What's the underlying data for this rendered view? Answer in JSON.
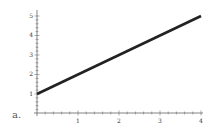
{
  "chart_data": {
    "type": "line",
    "title": "",
    "panel_label": "a.",
    "xlabel": "",
    "ylabel": "",
    "x_ticks": [
      "1",
      "2",
      "3",
      "4"
    ],
    "y_ticks": [
      "1",
      "2",
      "3",
      "4",
      "5"
    ],
    "xlim": [
      0,
      4
    ],
    "ylim": [
      0,
      5
    ],
    "grid": false,
    "legend": null,
    "series": [
      {
        "name": "y = x + 1",
        "x": [
          0,
          4
        ],
        "y": [
          1,
          5
        ],
        "color": "#222222"
      }
    ]
  }
}
